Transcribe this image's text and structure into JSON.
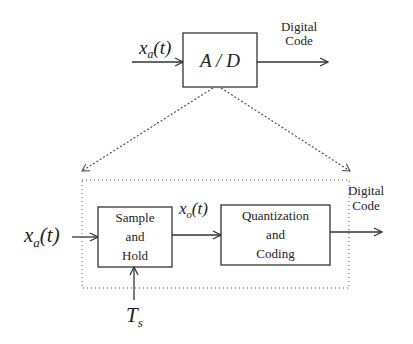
{
  "diagram": {
    "type": "block-diagram",
    "top": {
      "input_signal": {
        "symbol": "x",
        "subscript": "a",
        "arg": "(t)"
      },
      "block": {
        "label": "A / D"
      },
      "output_label_line1": "Digital",
      "output_label_line2": "Code"
    },
    "expansion": {
      "style": "dotted",
      "input_signal": {
        "symbol": "x",
        "subscript": "a",
        "arg": "(t)"
      },
      "blocks": [
        {
          "id": "sample-hold",
          "lines": [
            "Sample",
            "and",
            "Hold"
          ]
        },
        {
          "id": "quantization-coding",
          "lines": [
            "Quantization",
            "and",
            "Coding"
          ]
        }
      ],
      "intermediate_signal": {
        "symbol": "x",
        "subscript": "o",
        "arg": "(t)"
      },
      "clock_signal": {
        "symbol": "T",
        "subscript": "s"
      },
      "output_label_line1": "Digital",
      "output_label_line2": "Code"
    },
    "colors": {
      "stroke": "#333333",
      "background": "#ffffff"
    }
  }
}
